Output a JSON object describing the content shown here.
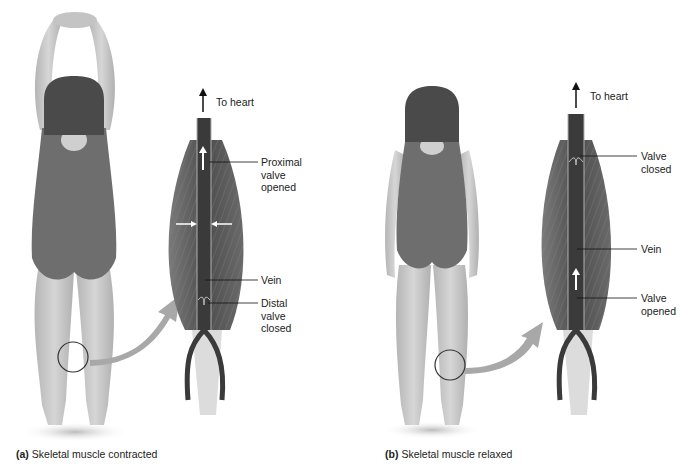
{
  "figure": {
    "panels": [
      {
        "id": "a",
        "caption_letter": "(a)",
        "caption_text": "Skeletal muscle contracted",
        "pose": "arms raised overhead, standing, rear view",
        "labels": {
          "to_heart": "To heart",
          "proximal_valve": "Proximal\nvalve\nopened",
          "vein": "Vein",
          "distal_valve": "Distal\nvalve\nclosed"
        }
      },
      {
        "id": "b",
        "caption_letter": "(b)",
        "caption_text": "Skeletal muscle relaxed",
        "pose": "arms at sides, standing, rear view",
        "labels": {
          "to_heart": "To heart",
          "upper_valve": "Valve\nclosed",
          "vein": "Vein",
          "lower_valve": "Valve\nopened"
        }
      }
    ],
    "colors": {
      "skin": "#c9c9c9",
      "swimsuit": "#6e6e6e",
      "hair": "#4a4a4a",
      "muscle": "#5e5e5e",
      "vein": "#3a3a3a",
      "tendon": "#dcdcdc",
      "arrow_callout": "#a8a8a8"
    }
  }
}
